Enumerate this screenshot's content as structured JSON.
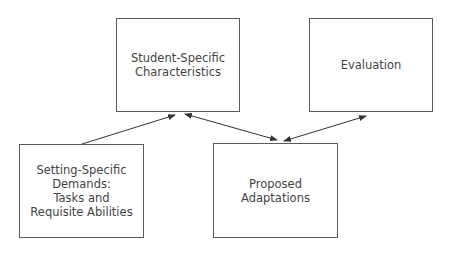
{
  "diagram": {
    "nodes": [
      {
        "id": "student",
        "label": "Student-Specific\nCharacteristics"
      },
      {
        "id": "evaluation",
        "label": "Evaluation"
      },
      {
        "id": "setting",
        "label": "Setting-Specific\nDemands:\nTasks and\nRequisite Abilities"
      },
      {
        "id": "proposed",
        "label": "Proposed\nAdaptations"
      }
    ],
    "edges": [
      {
        "from": "setting",
        "to": "student",
        "direction": "one-way"
      },
      {
        "from": "student",
        "to": "proposed",
        "direction": "two-way"
      },
      {
        "from": "proposed",
        "to": "evaluation",
        "direction": "two-way"
      }
    ]
  }
}
